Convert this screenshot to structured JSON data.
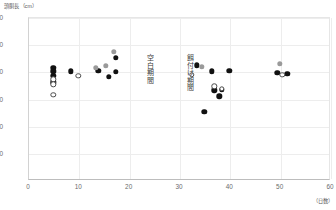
{
  "chart_data": {
    "type": "scatter",
    "title": "",
    "ylabel": "頭胴長（cm）",
    "xlabel": "（日数）",
    "ylim": [
      0,
      120
    ],
    "xlim": [
      0,
      60
    ],
    "yticks": [
      120,
      100,
      80,
      60,
      40,
      20
    ],
    "xticks": [
      0,
      10,
      20,
      30,
      40,
      50,
      60
    ],
    "grid": true,
    "legend_position": "none",
    "annotations": [
      {
        "text": "空白期間",
        "x": 24,
        "y": 78
      },
      {
        "text": "餌付け期間",
        "x": 32,
        "y": 78
      }
    ],
    "series": [
      {
        "name": "黒丸",
        "marker": "filled-circle",
        "color": "#111111",
        "points": [
          {
            "x": 5.0,
            "y": 82.5
          },
          {
            "x": 5.0,
            "y": 80.0
          },
          {
            "x": 5.0,
            "y": 76.5
          },
          {
            "x": 5.0,
            "y": 72.0
          },
          {
            "x": 8.5,
            "y": 80.0
          },
          {
            "x": 14.0,
            "y": 80.5
          },
          {
            "x": 17.5,
            "y": 90.0
          },
          {
            "x": 17.5,
            "y": 79.5
          },
          {
            "x": 16.0,
            "y": 76.0
          },
          {
            "x": 33.5,
            "y": 84.5
          },
          {
            "x": 35.0,
            "y": 50.0
          },
          {
            "x": 36.5,
            "y": 80.0
          },
          {
            "x": 37.0,
            "y": 66.0
          },
          {
            "x": 38.0,
            "y": 61.5
          },
          {
            "x": 38.5,
            "y": 66.5
          },
          {
            "x": 40.0,
            "y": 80.5
          },
          {
            "x": 49.5,
            "y": 79.0
          },
          {
            "x": 51.5,
            "y": 78.0
          }
        ]
      },
      {
        "name": "灰丸",
        "marker": "gray-circle",
        "color": "#9a9a9a",
        "points": [
          {
            "x": 17.0,
            "y": 94.5
          },
          {
            "x": 15.5,
            "y": 84.0
          },
          {
            "x": 13.5,
            "y": 82.5
          },
          {
            "x": 34.5,
            "y": 83.5
          },
          {
            "x": 50.0,
            "y": 85.5
          }
        ]
      },
      {
        "name": "白丸",
        "marker": "open-circle",
        "color": "#ffffff",
        "points": [
          {
            "x": 5.0,
            "y": 74.0
          },
          {
            "x": 5.0,
            "y": 70.5
          },
          {
            "x": 5.0,
            "y": 62.5
          },
          {
            "x": 10.0,
            "y": 76.5
          },
          {
            "x": 32.5,
            "y": 77.5
          },
          {
            "x": 37.0,
            "y": 69.0
          },
          {
            "x": 38.5,
            "y": 67.0
          },
          {
            "x": 50.5,
            "y": 77.5
          }
        ]
      }
    ]
  }
}
